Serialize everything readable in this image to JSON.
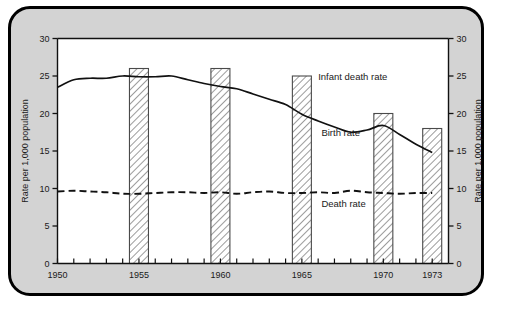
{
  "figure": {
    "background_color": "#d3d3d3",
    "plot_background_color": "#ffffff",
    "border_color": "#000000"
  },
  "chart_data": {
    "type": "line",
    "title": "",
    "subtitle": "",
    "xlabel": "",
    "ylabel": "Rate per 1,000 population",
    "ylabel_right": "Rate per 1,000 population",
    "xlim": [
      1950,
      1974
    ],
    "ylim": [
      0,
      30
    ],
    "grid": false,
    "legend_position": "inline-annotations",
    "y_ticks": [
      0,
      5,
      10,
      15,
      20,
      25,
      30
    ],
    "y_tick_labels": [
      "0",
      "5",
      "10",
      "15",
      "20",
      "25",
      "30"
    ],
    "y_ticks_right": [
      0,
      5,
      10,
      15,
      20,
      25,
      30
    ],
    "y_tick_labels_right": [
      "0",
      "5",
      "10",
      "15",
      "20",
      "25",
      "30"
    ],
    "x_ticks": [
      1950,
      1951,
      1952,
      1953,
      1954,
      1955,
      1956,
      1957,
      1958,
      1959,
      1960,
      1961,
      1962,
      1963,
      1964,
      1965,
      1966,
      1967,
      1968,
      1969,
      1970,
      1971,
      1972,
      1973
    ],
    "x_tick_labels": [
      {
        "x": 1950,
        "label": "1950"
      },
      {
        "x": 1955,
        "label": "1955"
      },
      {
        "x": 1960,
        "label": "1960"
      },
      {
        "x": 1965,
        "label": "1965"
      },
      {
        "x": 1970,
        "label": "1970"
      },
      {
        "x": 1973,
        "label": "1973"
      }
    ],
    "series": [
      {
        "name": "Infant death rate",
        "type": "bar",
        "style": "hatched",
        "label": "Infant death rate",
        "categories": [
          1955,
          1960,
          1965,
          1970,
          1973
        ],
        "values": [
          26.0,
          26.0,
          25.0,
          20.0,
          18.0
        ]
      },
      {
        "name": "Birth rate",
        "type": "line",
        "style": "solid",
        "label": "Birth rate",
        "x": [
          1950,
          1951,
          1952,
          1953,
          1954,
          1955,
          1956,
          1957,
          1958,
          1959,
          1960,
          1961,
          1962,
          1963,
          1964,
          1965,
          1966,
          1967,
          1968,
          1969,
          1970,
          1971,
          1972,
          1973
        ],
        "values": [
          23.5,
          24.5,
          24.7,
          24.7,
          25.0,
          24.9,
          24.9,
          25.0,
          24.5,
          24.0,
          23.6,
          23.3,
          22.6,
          21.9,
          21.2,
          19.9,
          19.0,
          18.2,
          17.5,
          17.8,
          18.4,
          17.2,
          15.9,
          14.8
        ]
      },
      {
        "name": "Death rate",
        "type": "line",
        "style": "dashed",
        "label": "Death rate",
        "x": [
          1950,
          1951,
          1952,
          1953,
          1954,
          1955,
          1956,
          1957,
          1958,
          1959,
          1960,
          1961,
          1962,
          1963,
          1964,
          1965,
          1966,
          1967,
          1968,
          1969,
          1970,
          1971,
          1972,
          1973
        ],
        "values": [
          9.6,
          9.7,
          9.6,
          9.5,
          9.3,
          9.3,
          9.4,
          9.5,
          9.5,
          9.4,
          9.5,
          9.3,
          9.5,
          9.6,
          9.4,
          9.4,
          9.5,
          9.4,
          9.7,
          9.5,
          9.4,
          9.3,
          9.4,
          9.4
        ]
      }
    ],
    "annotations": [
      {
        "name": "infant-death-rate-label",
        "text": "Infant death rate",
        "x": 1966.0,
        "y": 25.0
      },
      {
        "name": "birth-rate-label",
        "text": "Birth rate",
        "x": 1966.2,
        "y": 17.5
      },
      {
        "name": "death-rate-label",
        "text": "Death rate",
        "x": 1966.2,
        "y": 8.0
      }
    ]
  }
}
